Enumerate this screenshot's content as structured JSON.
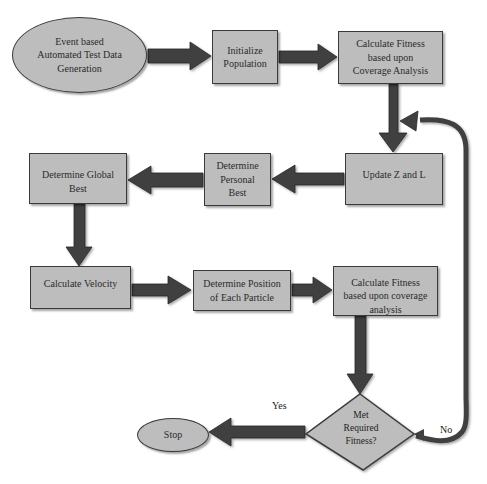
{
  "diagram": {
    "type": "flowchart",
    "title": "",
    "colors": {
      "node_fill": "#bdbdbd",
      "node_border": "#3a3a3a",
      "arrow_fill": "#404040",
      "background": "#ffffff"
    },
    "nodes": [
      {
        "id": "start",
        "shape": "ellipse",
        "label": "Event based Automated Test Data Generation"
      },
      {
        "id": "init",
        "shape": "rect",
        "label": "Initialize Population"
      },
      {
        "id": "fitness1",
        "shape": "rect",
        "label": "Calculate Fitness based upon Coverage Analysis"
      },
      {
        "id": "update",
        "shape": "rect",
        "label": "Update Z and L"
      },
      {
        "id": "personal",
        "shape": "rect",
        "label": "Determine Personal Best"
      },
      {
        "id": "global",
        "shape": "rect",
        "label": "Determine Global Best"
      },
      {
        "id": "velocity",
        "shape": "rect",
        "label": "Calculate Velocity"
      },
      {
        "id": "position",
        "shape": "rect",
        "label": "Determine Position of Each Particle"
      },
      {
        "id": "fitness2",
        "shape": "rect",
        "label": "Calculate Fitness based upon coverage analysis"
      },
      {
        "id": "decision",
        "shape": "diamond",
        "label": "Met Required Fitness?"
      },
      {
        "id": "stop",
        "shape": "ellipse",
        "label": "Stop"
      }
    ],
    "edges": [
      {
        "from": "start",
        "to": "init",
        "label": ""
      },
      {
        "from": "init",
        "to": "fitness1",
        "label": ""
      },
      {
        "from": "fitness1",
        "to": "update",
        "label": ""
      },
      {
        "from": "update",
        "to": "personal",
        "label": ""
      },
      {
        "from": "personal",
        "to": "global",
        "label": ""
      },
      {
        "from": "global",
        "to": "velocity",
        "label": ""
      },
      {
        "from": "velocity",
        "to": "position",
        "label": ""
      },
      {
        "from": "position",
        "to": "fitness2",
        "label": ""
      },
      {
        "from": "fitness2",
        "to": "decision",
        "label": ""
      },
      {
        "from": "decision",
        "to": "stop",
        "label": "Yes"
      },
      {
        "from": "decision",
        "to": "update",
        "label": "No"
      }
    ],
    "edge_labels": {
      "yes": "Yes",
      "no": "No"
    },
    "decision_lines": [
      "Met",
      "Required",
      "Fitness?"
    ]
  }
}
